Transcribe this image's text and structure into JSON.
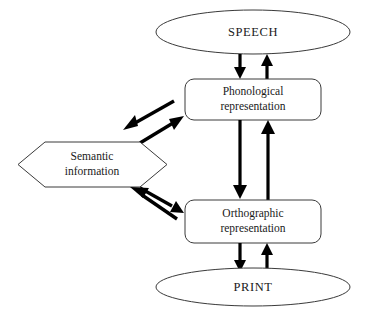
{
  "diagram": {
    "type": "flow-diagram",
    "background_color": "#ffffff",
    "line_color": "#3a3a3a",
    "arrow_color": "#000000",
    "text_color": "#1a1a1a",
    "nodes": [
      {
        "id": "speech",
        "label": "SPEECH",
        "shape": "ellipse",
        "cx": 253,
        "cy": 32,
        "rx": 97,
        "ry": 22
      },
      {
        "id": "phonological",
        "label_line1": "Phonological",
        "label_line2": "representation",
        "shape": "rounded-rectangle",
        "x": 185,
        "y": 79,
        "width": 136,
        "height": 41,
        "corner_radius": 9
      },
      {
        "id": "semantic",
        "label_line1": "Semantic",
        "label_line2": "information",
        "shape": "hexagon",
        "x": 18,
        "y": 142,
        "width": 149,
        "height": 45
      },
      {
        "id": "orthographic",
        "label_line1": "Orthographic",
        "label_line2": "representation",
        "shape": "rounded-rectangle",
        "x": 185,
        "y": 200,
        "width": 136,
        "height": 43,
        "corner_radius": 9
      },
      {
        "id": "print",
        "label": "PRINT",
        "shape": "ellipse",
        "cx": 253,
        "cy": 287,
        "rx": 97,
        "ry": 19
      }
    ],
    "edges": [
      {
        "id": "speech-to-phonological",
        "from": "speech",
        "to": "phonological",
        "direction": "down",
        "orientation": "vertical"
      },
      {
        "id": "phonological-to-speech",
        "from": "phonological",
        "to": "speech",
        "direction": "up",
        "orientation": "vertical"
      },
      {
        "id": "phonological-to-orthographic",
        "from": "phonological",
        "to": "orthographic",
        "direction": "down",
        "orientation": "vertical"
      },
      {
        "id": "orthographic-to-phonological",
        "from": "orthographic",
        "to": "phonological",
        "direction": "up",
        "orientation": "vertical"
      },
      {
        "id": "orthographic-to-print",
        "from": "orthographic",
        "to": "print",
        "direction": "down",
        "orientation": "vertical"
      },
      {
        "id": "print-to-orthographic",
        "from": "print",
        "to": "orthographic",
        "direction": "up",
        "orientation": "vertical"
      },
      {
        "id": "phonological-to-semantic",
        "from": "phonological",
        "to": "semantic",
        "direction": "down-left",
        "orientation": "diagonal"
      },
      {
        "id": "semantic-to-phonological",
        "from": "semantic",
        "to": "phonological",
        "direction": "up-right",
        "orientation": "diagonal"
      },
      {
        "id": "orthographic-to-semantic",
        "from": "orthographic",
        "to": "semantic",
        "direction": "up-left",
        "orientation": "diagonal"
      },
      {
        "id": "semantic-to-orthographic",
        "from": "semantic",
        "to": "orthographic",
        "direction": "down-right",
        "orientation": "diagonal"
      }
    ]
  }
}
